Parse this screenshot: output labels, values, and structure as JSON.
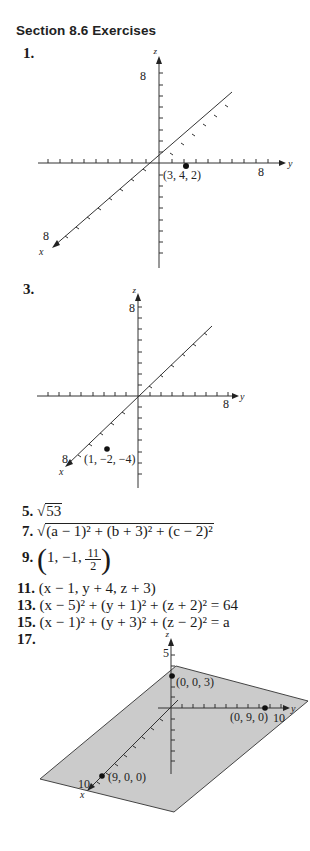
{
  "page": {
    "section_title": "Section 8.6 Exercises"
  },
  "exercises": [
    {
      "number": "1.",
      "type": "plot",
      "axis_max": "8",
      "point_label": "(3, 4, 2)",
      "axis_labels": {
        "x": "x",
        "y": "y",
        "z": "z"
      }
    },
    {
      "number": "3.",
      "type": "plot",
      "axis_max": "8",
      "point_label": "(1, −2, −4)",
      "axis_labels": {
        "x": "x",
        "y": "y",
        "z": "z"
      }
    },
    {
      "number": "5.",
      "type": "answer",
      "radicand": "53"
    },
    {
      "number": "7.",
      "type": "answer",
      "radicand": "(a − 1)² + (b + 3)² + (c − 2)²"
    },
    {
      "number": "9.",
      "type": "answer",
      "lead": "1, −1, ",
      "frac_num": "11",
      "frac_den": "2"
    },
    {
      "number": "11.",
      "type": "answer",
      "text": "(x − 1, y + 4, z + 3)"
    },
    {
      "number": "13.",
      "type": "answer",
      "text": "(x − 5)² + (y + 1)² + (z + 2)² = 64"
    },
    {
      "number": "15.",
      "type": "answer",
      "text": "(x − 1)² + (y + 3)² + (z − 2)² = a"
    },
    {
      "number": "17.",
      "type": "plot",
      "z_max": "5",
      "y_max": "10",
      "x_max": "10",
      "points": [
        "(0, 0, 3)",
        "(0, 9, 0)",
        "(9, 0, 0)"
      ],
      "axis_labels": {
        "x": "x",
        "y": "y",
        "z": "z"
      },
      "plane_color": "#c8c8c8"
    }
  ]
}
